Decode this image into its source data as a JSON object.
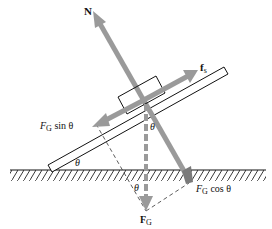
{
  "diagram": {
    "colors": {
      "force_arrow": "#9a9a9a",
      "outline": "#111111",
      "dashed": "#333333",
      "background": "#ffffff"
    },
    "labels": {
      "normal_force": "N",
      "static_friction": "f",
      "static_friction_sub": "s",
      "gravity_parallel_main": "F",
      "gravity_parallel_sub": "G",
      "gravity_parallel_tail": " sin θ",
      "gravity_perp_main": "F",
      "gravity_perp_sub": "G",
      "gravity_perp_tail": " cos θ",
      "gravity_main": "F",
      "gravity_sub": "G",
      "angle_incline": "θ",
      "angle_block": "θ",
      "angle_triangle": "θ"
    },
    "elements": [
      {
        "id": "ground",
        "type": "hatched surface"
      },
      {
        "id": "incline",
        "type": "inclined plank",
        "angle_symbol": "θ"
      },
      {
        "id": "block",
        "type": "rectangle on incline"
      },
      {
        "id": "normal-force-arrow",
        "label": "N",
        "direction": "perpendicular to incline, up-left"
      },
      {
        "id": "friction-arrow",
        "label": "f_s",
        "direction": "up the incline"
      },
      {
        "id": "gravity-parallel-arrow",
        "label": "F_G sin θ",
        "direction": "down the incline"
      },
      {
        "id": "gravity-arrow",
        "label": "F_G",
        "direction": "vertically down",
        "style": "dashed"
      },
      {
        "id": "gravity-perp-component",
        "label": "F_G cos θ",
        "direction": "perpendicular into incline"
      }
    ]
  }
}
